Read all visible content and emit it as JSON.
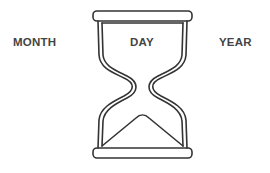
{
  "labels": {
    "left": "MONTH",
    "center": "DAY",
    "right": "YEAR"
  },
  "icon": "hourglass-icon",
  "colors": {
    "stroke": "#333333",
    "text": "#444444",
    "background": "#ffffff"
  }
}
